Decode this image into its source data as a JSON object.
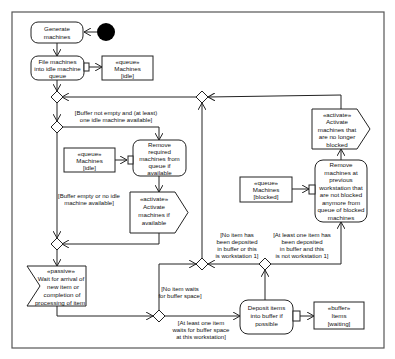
{
  "diagram": {
    "type": "UML activity diagram",
    "colors": {
      "stroke": "#222222",
      "fill": "#ffffff",
      "initial_node": "#000000",
      "frame": "#555555"
    },
    "nodes": {
      "generate": {
        "lines": [
          "Generate",
          "machines"
        ]
      },
      "file": {
        "lines": [
          "File machines",
          "into idle machine",
          "queue"
        ]
      },
      "queue_idle_top": {
        "lines": [
          "«queue»",
          "Machines",
          "[idle]"
        ]
      },
      "queue_idle_mid": {
        "lines": [
          "«queue»",
          "Machines",
          "[idle]"
        ]
      },
      "remove_required": {
        "lines": [
          "Remove",
          "required",
          "machines from",
          "queue if",
          "available"
        ]
      },
      "activate_if_available": {
        "lines": [
          "«activate»",
          "Activate",
          "machines if",
          "available"
        ]
      },
      "passive_wait": {
        "lines": [
          "«passive»",
          "Wait for arrival of",
          "new item or",
          "completion of",
          "processing of item"
        ]
      },
      "deposit": {
        "lines": [
          "Deposit items",
          "into buffer if",
          "possible"
        ]
      },
      "buffer_waiting": {
        "lines": [
          "«buffer»",
          "Items",
          "[waiting]"
        ]
      },
      "queue_blocked": {
        "lines": [
          "«queue»",
          "Machines",
          "[blocked]"
        ]
      },
      "remove_previous": {
        "lines": [
          "Remove",
          "machines at",
          "previous",
          "workstation that",
          "are not blocked",
          "anymore from",
          "queue of blocked",
          "machines"
        ]
      },
      "activate_no_longer_blocked": {
        "lines": [
          "«activate»",
          "Activate",
          "machines that",
          "are no longer",
          "blocked"
        ]
      }
    },
    "guards": {
      "buffer_not_empty": {
        "lines": [
          "[Buffer not empty and (at least)",
          "one idle machine available]"
        ]
      },
      "buffer_empty": {
        "lines": [
          "[Buffer empty or no idle",
          "machine available]"
        ]
      },
      "no_item_waits": {
        "lines": [
          "[No item waits",
          "for buffer space]"
        ]
      },
      "at_least_one_waits": {
        "lines": [
          "[At least one item",
          "waits for buffer space",
          "at this workstation]"
        ]
      },
      "no_item_deposited": {
        "lines": [
          "[No item has",
          "been deposited",
          "in buffer or this",
          "is workstation 1]"
        ]
      },
      "at_least_one_deposited": {
        "lines": [
          "[At least one item has",
          "been deposited",
          "in buffer and this",
          "is not workstation 1]"
        ]
      }
    }
  }
}
